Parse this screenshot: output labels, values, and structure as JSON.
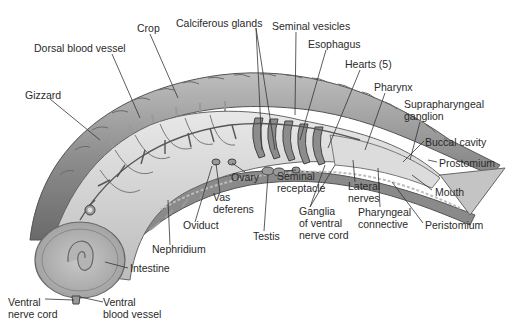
{
  "diagram": {
    "labels": [
      {
        "id": "crop",
        "text": "Crop",
        "x": 137,
        "y": 22
      },
      {
        "id": "calciferous-glands",
        "text": "Calciferous glands",
        "x": 176,
        "y": 17
      },
      {
        "id": "seminal-vesicles",
        "text": "Seminal vesicles",
        "x": 272,
        "y": 20
      },
      {
        "id": "dorsal-blood-vessel",
        "text": "Dorsal blood vessel",
        "x": 34,
        "y": 42
      },
      {
        "id": "esophagus",
        "text": "Esophagus",
        "x": 308,
        "y": 38
      },
      {
        "id": "hearts",
        "text": "Hearts (5)",
        "x": 345,
        "y": 58
      },
      {
        "id": "gizzard",
        "text": "Gizzard",
        "x": 25,
        "y": 89
      },
      {
        "id": "pharynx",
        "text": "Pharynx",
        "x": 374,
        "y": 81
      },
      {
        "id": "suprapharyngeal-ganglion",
        "text": "Suprapharyngeal\nganglion",
        "x": 404,
        "y": 98
      },
      {
        "id": "buccal-cavity",
        "text": "Buccal cavity",
        "x": 425,
        "y": 136
      },
      {
        "id": "prostomium",
        "text": "Prostomium",
        "x": 439,
        "y": 157
      },
      {
        "id": "ovary",
        "text": "Ovary",
        "x": 231,
        "y": 171
      },
      {
        "id": "seminal-receptacle",
        "text": "Seminal\nreceptacle",
        "x": 277,
        "y": 170
      },
      {
        "id": "lateral-nerves",
        "text": "Lateral\nnerves",
        "x": 348,
        "y": 180
      },
      {
        "id": "mouth",
        "text": "Mouth",
        "x": 435,
        "y": 186
      },
      {
        "id": "vas-deferens",
        "text": "Vas\ndeferens",
        "x": 213,
        "y": 191
      },
      {
        "id": "ganglia-ventral-nerve-cord",
        "text": "Ganglia\nof ventral\nnerve cord",
        "x": 299,
        "y": 205
      },
      {
        "id": "pharyngeal-connective",
        "text": "Pharyngeal\nconnective",
        "x": 358,
        "y": 206
      },
      {
        "id": "oviduct",
        "text": "Oviduct",
        "x": 183,
        "y": 219
      },
      {
        "id": "peristomium",
        "text": "Peristomium",
        "x": 425,
        "y": 219
      },
      {
        "id": "testis",
        "text": "Testis",
        "x": 253,
        "y": 230
      },
      {
        "id": "nephridium",
        "text": "Nephridium",
        "x": 152,
        "y": 243
      },
      {
        "id": "intestine",
        "text": "Intestine",
        "x": 130,
        "y": 262
      },
      {
        "id": "ventral-nerve-cord",
        "text": "Ventral\nnerve cord",
        "x": 8,
        "y": 296
      },
      {
        "id": "ventral-blood-vessel",
        "text": "Ventral\nblood vessel",
        "x": 103,
        "y": 296
      }
    ],
    "colors": {
      "body_wall": "#9a9a9a",
      "body_wall_dark": "#6e6e6e",
      "gut": "#d2d2d2",
      "gut_light": "#e6e6e6",
      "vessels": "#5a5a5a",
      "leader_lines": "#333333",
      "text": "#2a2a2a"
    }
  }
}
